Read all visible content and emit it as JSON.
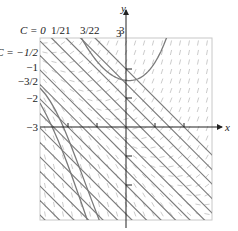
{
  "figure": {
    "type": "slope-field",
    "x_axis_label": "x",
    "y_axis_label": "y",
    "y_top_label": "3",
    "x_left_label": "-3",
    "top_c_labels": [
      {
        "text": "C = 0",
        "x": 40
      },
      {
        "text": "1/2",
        "x": 54
      },
      {
        "text": "1",
        "x": 68
      },
      {
        "text": "3/2",
        "x": 83
      },
      {
        "text": "2",
        "x": 97
      },
      {
        "text": "3",
        "x": 122
      }
    ],
    "left_c_labels": [
      {
        "text": "C = -1/2",
        "y": 52
      },
      {
        "text": "-1",
        "y": 67
      },
      {
        "text": "-3/2",
        "y": 81
      },
      {
        "text": "-2",
        "y": 98
      },
      {
        "text": "-3",
        "y": 127
      }
    ],
    "colors": {
      "curve": "#7a7a7a",
      "axis": "#222222",
      "field": "#b5b5b5",
      "frame": "#c8c8c8"
    },
    "plot_box": {
      "left": 40,
      "top": 38,
      "right": 212,
      "bottom": 220
    },
    "origin": {
      "x": 126,
      "y": 127
    },
    "unit_px": 29
  }
}
